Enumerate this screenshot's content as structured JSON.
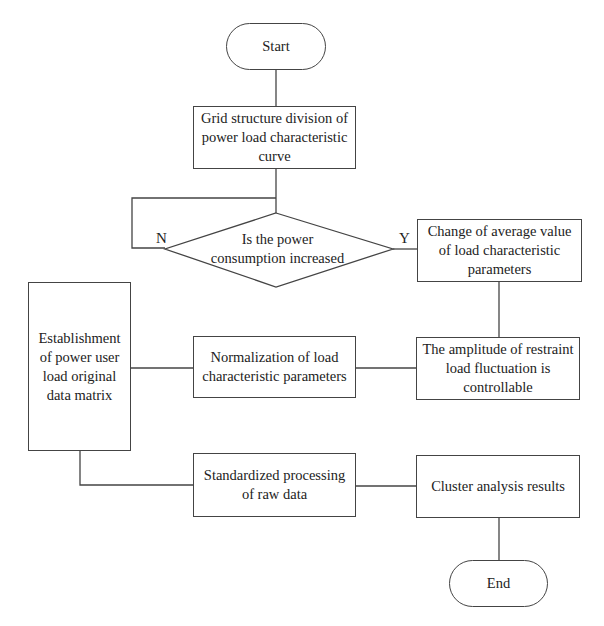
{
  "flowchart": {
    "start": "Start",
    "grid_structure": "Grid structure division of power load characteristic curve",
    "decision": "Is the power consumption increased",
    "no_label": "N",
    "yes_label": "Y",
    "change_average": "Change of average value of load characteristic parameters",
    "restraint_amplitude": "The amplitude of restraint load fluctuation is controllable",
    "normalization": "Normalization of load characteristic parameters",
    "establishment": "Establishment of power user load original data matrix",
    "standardized": "Standardized processing of raw data",
    "cluster": "Cluster analysis results",
    "end": "End"
  }
}
